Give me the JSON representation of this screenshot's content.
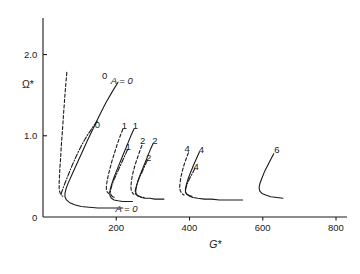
{
  "chart_data": {
    "type": "line",
    "title": "",
    "subtitle": "",
    "xlabel": "G*",
    "ylabel": "Ω*",
    "xlim": [
      0,
      830
    ],
    "ylim": [
      0,
      2.45
    ],
    "grid": false,
    "legend_position": "none",
    "x_ticks": [
      {
        "value": 200,
        "label": "200"
      },
      {
        "value": 400,
        "label": "400"
      },
      {
        "value": 600,
        "label": "600"
      },
      {
        "value": 800,
        "label": "800"
      }
    ],
    "y_ticks": [
      {
        "value": 2.0,
        "label": "2.0"
      },
      {
        "value": 1.0,
        "label": "1.0"
      }
    ],
    "origin_label": "0",
    "annotations": [
      {
        "text": "0",
        "x": 168,
        "y": 1.73,
        "style": "plain"
      },
      {
        "text": "A = 0",
        "x": 215,
        "y": 1.68,
        "style": "italic"
      },
      {
        "text": "0",
        "x": 148,
        "y": 1.13,
        "style": "plain"
      },
      {
        "text": "A = 0",
        "x": 228,
        "y": 0.1,
        "style": "italic"
      },
      {
        "text": "1",
        "x": 222,
        "y": 1.12,
        "style": "plain"
      },
      {
        "text": "1",
        "x": 252,
        "y": 1.12,
        "style": "plain"
      },
      {
        "text": "1",
        "x": 232,
        "y": 0.86,
        "style": "plain"
      },
      {
        "text": "2",
        "x": 272,
        "y": 0.93,
        "style": "plain"
      },
      {
        "text": "2",
        "x": 305,
        "y": 0.94,
        "style": "plain"
      },
      {
        "text": "2",
        "x": 288,
        "y": 0.73,
        "style": "plain"
      },
      {
        "text": "4",
        "x": 393,
        "y": 0.84,
        "style": "plain"
      },
      {
        "text": "4",
        "x": 432,
        "y": 0.82,
        "style": "plain"
      },
      {
        "text": "4",
        "x": 418,
        "y": 0.62,
        "style": "plain"
      },
      {
        "text": "6",
        "x": 638,
        "y": 0.82,
        "style": "plain"
      }
    ],
    "series": [
      {
        "name": "A = 0 (dashed)",
        "linestyle": "dashed",
        "points": [
          [
            65,
            1.78
          ],
          [
            62,
            1.62
          ],
          [
            59,
            1.45
          ],
          [
            56,
            1.26
          ],
          [
            53,
            1.06
          ],
          [
            50,
            0.88
          ],
          [
            48,
            0.72
          ],
          [
            46,
            0.6
          ],
          [
            45,
            0.5
          ],
          [
            44,
            0.42
          ],
          [
            44,
            0.36
          ],
          [
            45,
            0.32
          ],
          [
            47,
            0.29
          ],
          [
            50,
            0.27
          ]
        ]
      },
      {
        "name": "A = 0 (dash-dot)",
        "linestyle": "dashdot",
        "points": [
          [
            148,
            1.18
          ],
          [
            135,
            1.1
          ],
          [
            120,
            1.0
          ],
          [
            105,
            0.88
          ],
          [
            92,
            0.76
          ],
          [
            80,
            0.64
          ],
          [
            70,
            0.53
          ],
          [
            62,
            0.44
          ],
          [
            56,
            0.37
          ],
          [
            52,
            0.32
          ],
          [
            50,
            0.29
          ],
          [
            50,
            0.27
          ],
          [
            52,
            0.26
          ],
          [
            56,
            0.25
          ]
        ]
      },
      {
        "name": "A = 0 (solid)",
        "linestyle": "solid",
        "points": [
          [
            205,
            1.66
          ],
          [
            190,
            1.55
          ],
          [
            172,
            1.41
          ],
          [
            155,
            1.26
          ],
          [
            138,
            1.1
          ],
          [
            120,
            0.93
          ],
          [
            104,
            0.77
          ],
          [
            90,
            0.63
          ],
          [
            78,
            0.51
          ],
          [
            69,
            0.42
          ],
          [
            63,
            0.35
          ],
          [
            60,
            0.29
          ],
          [
            60,
            0.25
          ],
          [
            64,
            0.21
          ],
          [
            72,
            0.18
          ],
          [
            86,
            0.15
          ],
          [
            104,
            0.13
          ],
          [
            126,
            0.12
          ],
          [
            150,
            0.11
          ],
          [
            175,
            0.11
          ],
          [
            200,
            0.11
          ],
          [
            218,
            0.11
          ]
        ]
      },
      {
        "name": "A = 1 (dashed)",
        "linestyle": "dashed",
        "points": [
          [
            218,
            1.08
          ],
          [
            211,
            1.0
          ],
          [
            203,
            0.9
          ],
          [
            196,
            0.8
          ],
          [
            189,
            0.7
          ],
          [
            183,
            0.6
          ],
          [
            178,
            0.51
          ],
          [
            175,
            0.44
          ],
          [
            173,
            0.38
          ],
          [
            173,
            0.34
          ],
          [
            175,
            0.31
          ],
          [
            179,
            0.29
          ]
        ]
      },
      {
        "name": "A = 1 (dash-dot)",
        "linestyle": "dashdot",
        "points": [
          [
            231,
            0.83
          ],
          [
            224,
            0.76
          ],
          [
            216,
            0.68
          ],
          [
            208,
            0.6
          ],
          [
            200,
            0.52
          ],
          [
            193,
            0.45
          ],
          [
            188,
            0.39
          ],
          [
            185,
            0.34
          ],
          [
            184,
            0.3
          ],
          [
            186,
            0.27
          ],
          [
            190,
            0.25
          ],
          [
            196,
            0.24
          ]
        ]
      },
      {
        "name": "A = 1 (solid)",
        "linestyle": "solid",
        "points": [
          [
            248,
            1.08
          ],
          [
            240,
            1.0
          ],
          [
            231,
            0.9
          ],
          [
            221,
            0.79
          ],
          [
            211,
            0.68
          ],
          [
            202,
            0.58
          ],
          [
            194,
            0.49
          ],
          [
            188,
            0.41
          ],
          [
            184,
            0.35
          ],
          [
            182,
            0.3
          ],
          [
            183,
            0.26
          ],
          [
            187,
            0.23
          ],
          [
            194,
            0.21
          ],
          [
            205,
            0.2
          ],
          [
            218,
            0.19
          ],
          [
            232,
            0.19
          ],
          [
            244,
            0.19
          ]
        ]
      },
      {
        "name": "A = 2 (dashed)",
        "linestyle": "dashed",
        "points": [
          [
            270,
            0.88
          ],
          [
            264,
            0.81
          ],
          [
            258,
            0.73
          ],
          [
            252,
            0.65
          ],
          [
            247,
            0.57
          ],
          [
            243,
            0.49
          ],
          [
            241,
            0.42
          ],
          [
            240,
            0.37
          ],
          [
            241,
            0.33
          ],
          [
            244,
            0.3
          ],
          [
            248,
            0.28
          ]
        ]
      },
      {
        "name": "A = 2 (dash-dot)",
        "linestyle": "dashdot",
        "points": [
          [
            285,
            0.7
          ],
          [
            279,
            0.64
          ],
          [
            272,
            0.57
          ],
          [
            265,
            0.5
          ],
          [
            259,
            0.44
          ],
          [
            255,
            0.38
          ],
          [
            252,
            0.33
          ],
          [
            252,
            0.3
          ],
          [
            254,
            0.27
          ],
          [
            259,
            0.26
          ],
          [
            266,
            0.25
          ],
          [
            276,
            0.24
          ]
        ]
      },
      {
        "name": "A = 2 (solid)",
        "linestyle": "solid",
        "points": [
          [
            300,
            0.9
          ],
          [
            293,
            0.83
          ],
          [
            285,
            0.74
          ],
          [
            277,
            0.65
          ],
          [
            269,
            0.56
          ],
          [
            262,
            0.48
          ],
          [
            257,
            0.41
          ],
          [
            254,
            0.35
          ],
          [
            253,
            0.31
          ],
          [
            255,
            0.28
          ],
          [
            260,
            0.26
          ],
          [
            268,
            0.24
          ],
          [
            279,
            0.23
          ],
          [
            292,
            0.23
          ],
          [
            305,
            0.22
          ],
          [
            318,
            0.22
          ],
          [
            330,
            0.22
          ]
        ]
      },
      {
        "name": "A = 4 (dashed)",
        "linestyle": "dashed",
        "points": [
          [
            397,
            0.79
          ],
          [
            391,
            0.72
          ],
          [
            385,
            0.64
          ],
          [
            380,
            0.56
          ],
          [
            376,
            0.48
          ],
          [
            374,
            0.41
          ],
          [
            373,
            0.36
          ],
          [
            375,
            0.32
          ],
          [
            379,
            0.29
          ],
          [
            385,
            0.27
          ]
        ]
      },
      {
        "name": "A = 4 (dash-dot)",
        "linestyle": "dashdot",
        "points": [
          [
            415,
            0.6
          ],
          [
            408,
            0.54
          ],
          [
            401,
            0.48
          ],
          [
            395,
            0.42
          ],
          [
            391,
            0.37
          ],
          [
            389,
            0.33
          ],
          [
            390,
            0.3
          ],
          [
            394,
            0.28
          ],
          [
            401,
            0.26
          ],
          [
            411,
            0.25
          ]
        ]
      },
      {
        "name": "A = 4 (solid)",
        "linestyle": "solid",
        "points": [
          [
            427,
            0.8
          ],
          [
            420,
            0.73
          ],
          [
            412,
            0.65
          ],
          [
            404,
            0.56
          ],
          [
            397,
            0.48
          ],
          [
            392,
            0.41
          ],
          [
            389,
            0.35
          ],
          [
            389,
            0.31
          ],
          [
            392,
            0.28
          ],
          [
            399,
            0.26
          ],
          [
            409,
            0.24
          ],
          [
            423,
            0.23
          ],
          [
            440,
            0.22
          ],
          [
            460,
            0.22
          ],
          [
            482,
            0.21
          ],
          [
            505,
            0.21
          ],
          [
            528,
            0.21
          ],
          [
            545,
            0.21
          ]
        ]
      },
      {
        "name": "A = 6 (solid)",
        "linestyle": "solid",
        "points": [
          [
            630,
            0.78
          ],
          [
            622,
            0.71
          ],
          [
            613,
            0.63
          ],
          [
            604,
            0.55
          ],
          [
            597,
            0.47
          ],
          [
            592,
            0.41
          ],
          [
            590,
            0.36
          ],
          [
            592,
            0.32
          ],
          [
            598,
            0.29
          ],
          [
            608,
            0.27
          ],
          [
            622,
            0.25
          ],
          [
            639,
            0.24
          ],
          [
            655,
            0.23
          ]
        ]
      }
    ]
  }
}
